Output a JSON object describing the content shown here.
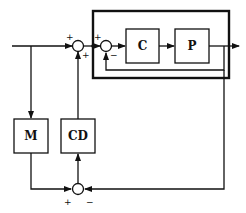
{
  "diagram": {
    "type": "block-diagram",
    "blocks": {
      "controller": "C",
      "plant": "P",
      "model": "M",
      "disturbance_compensator": "CD"
    },
    "summing_junctions": {
      "outer": {
        "signs": [
          "+",
          "+"
        ]
      },
      "inner": {
        "signs": [
          "+",
          "−"
        ]
      },
      "bottom": {
        "signs": [
          "+",
          "−"
        ]
      }
    },
    "color": "#111111"
  }
}
